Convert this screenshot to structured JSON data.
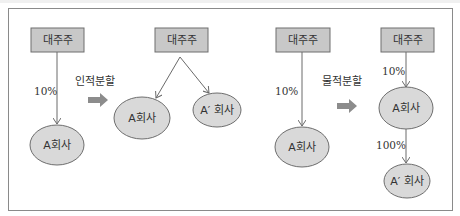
{
  "diagram": {
    "colors": {
      "box_fill": "#c8c8c8",
      "ellipse_fill": "#d9d9d9",
      "stroke": "#6e6e6e",
      "arrow_fill": "#8c8c8c"
    },
    "physical_split_left": null,
    "human_split": {
      "operation_label": "인적분할",
      "before": {
        "shareholder": "대주주",
        "ownership": "10%",
        "company": "A회사"
      },
      "after": {
        "shareholder": "대주주",
        "companies": [
          "A회사",
          "A′ 회사"
        ]
      }
    },
    "material_split": {
      "operation_label": "물적분할",
      "before": {
        "shareholder": "대주주",
        "ownership": "10%",
        "company": "A회사"
      },
      "after": {
        "shareholder": "대주주",
        "ownership": "10%",
        "company": "A회사",
        "subsidiary_ownership": "100%",
        "subsidiary": "A′ 회사"
      }
    }
  }
}
